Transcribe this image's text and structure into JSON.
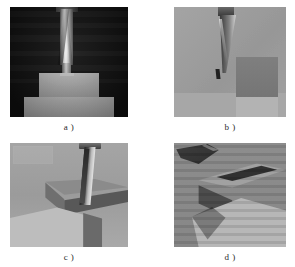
{
  "figure": {
    "layout": {
      "rows": 2,
      "columns": 2
    },
    "background_color": "#ffffff"
  },
  "panels": [
    {
      "id": "a",
      "caption": "a )",
      "description": "Front view, dark background: bright metallic end-mill shaft descending vertically onto two stacked light-gray stepped blocks",
      "view": "front orthographic",
      "background_color": "#141414",
      "tool_color": "#eeeeee",
      "workpiece_color": "#b4b4b4",
      "frame": {
        "x": 10,
        "y": 7,
        "width": 118,
        "height": 110
      }
    },
    {
      "id": "b",
      "caption": "b )",
      "description": "Light-gray background: slender dark tapered tool angled downward beside a darker gray rectangular block",
      "view": "front orthographic",
      "background_color": "#9d9d9d",
      "tool_color": "#2c2c2c",
      "workpiece_color": "#7b7b7b",
      "frame": {
        "x": 174,
        "y": 7,
        "width": 112,
        "height": 110
      }
    },
    {
      "id": "c",
      "caption": "c )",
      "description": "Oblique perspective: end mill cutting a slot in stepped gray blocks seen from a raised three-quarter angle",
      "view": "oblique perspective",
      "background_color": "#9a9a9a",
      "tool_color": "#d0d0d0",
      "workpiece_color": "#a8a8a8",
      "frame": {
        "x": 10,
        "y": 143,
        "width": 118,
        "height": 104
      }
    },
    {
      "id": "d",
      "caption": "d )",
      "description": "Steep oblique perspective with horizontal scan-line texture: tool and machined stepped block with strong cast shadows",
      "view": "steep oblique perspective",
      "background_color": "#8f8f8f",
      "tool_color": "#3a3a3a",
      "workpiece_color": "#a2a2a2",
      "frame": {
        "x": 174,
        "y": 143,
        "width": 112,
        "height": 104
      }
    }
  ]
}
